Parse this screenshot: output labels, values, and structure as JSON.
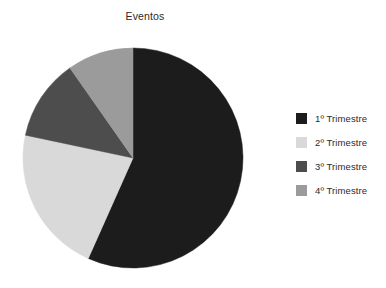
{
  "chart_data": {
    "type": "pie",
    "title": "Eventos",
    "xlabel": "",
    "ylabel": "",
    "categories": [
      "1º Trimestre",
      "2º Trimestre",
      "3º Trimestre",
      "4º Trimestre"
    ],
    "values": [
      56.7,
      21.7,
      11.9,
      9.7
    ],
    "units": "percent",
    "start_angle_deg": 90,
    "direction": "clockwise",
    "grid": false,
    "legend_position": "right",
    "slice_colors": [
      "#1c1c1c",
      "#d9d9d9",
      "#4d4d4d",
      "#9b9b9b"
    ],
    "slices": [
      {
        "label": "1º Trimestre",
        "value": 56.7,
        "color": "#1c1c1c",
        "start_deg": 0,
        "end_deg": 204
      },
      {
        "label": "2º Trimestre",
        "value": 21.7,
        "color": "#d9d9d9",
        "start_deg": 204,
        "end_deg": 282
      },
      {
        "label": "3º Trimestre",
        "value": 11.9,
        "color": "#4d4d4d",
        "start_deg": 282,
        "end_deg": 325
      },
      {
        "label": "4º Trimestre",
        "value": 9.7,
        "color": "#9b9b9b",
        "start_deg": 325,
        "end_deg": 360
      }
    ]
  },
  "title": {
    "text": "Eventos"
  },
  "legend": {
    "items": [
      {
        "label": "1º Trimestre",
        "color": "#1c1c1c"
      },
      {
        "label": "2º Trimestre",
        "color": "#d9d9d9"
      },
      {
        "label": "3º Trimestre",
        "color": "#4d4d4d"
      },
      {
        "label": "4º Trimestre",
        "color": "#9b9b9b"
      }
    ]
  },
  "canvas": {
    "background": "#ffffff",
    "pie_center_x": 133,
    "pie_center_y": 130,
    "pie_radius": 110
  }
}
